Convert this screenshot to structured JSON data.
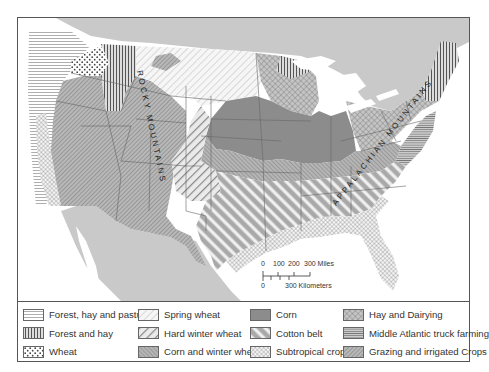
{
  "map": {
    "title": "Agricultural regions of the United States",
    "labels": {
      "rocky": "ROCKY MOUNTAINS",
      "appalachian": "APPALACHIAN MOUNTAINS"
    },
    "colors": {
      "water": "#ffffff",
      "foreign_land": "#c9c9c9",
      "pattern_gray": "#8a8a8a",
      "corn_fill": "#8c8c8c",
      "border": "#555555"
    }
  },
  "scale": {
    "miles_ticks": [
      "0",
      "100",
      "200",
      "300 Miles"
    ],
    "km_ticks": [
      "0",
      "300 Kilometers"
    ]
  },
  "legend": {
    "items": [
      {
        "label": "Forest, hay and pasture",
        "pattern": "horizontal-lines"
      },
      {
        "label": "Forest and hay",
        "pattern": "vertical-lines"
      },
      {
        "label": "Wheat",
        "pattern": "dots"
      },
      {
        "label": "Spring wheat",
        "pattern": "light-diagonal"
      },
      {
        "label": "Hard winter wheat",
        "pattern": "wide-diagonal"
      },
      {
        "label": "Corn and winter wheat",
        "pattern": "dense-forward-diagonal"
      },
      {
        "label": "Corn",
        "pattern": "solid-gray"
      },
      {
        "label": "Cotton belt",
        "pattern": "wide-white-stripes"
      },
      {
        "label": "Subtropical crops",
        "pattern": "crosshatch-light"
      },
      {
        "label": "Hay and Dairying",
        "pattern": "crosshatch"
      },
      {
        "label": "Middle Atlantic truck farming",
        "pattern": "horizontal-dense"
      },
      {
        "label": "Grazing and irrigated Crops",
        "pattern": "dense-back-diagonal"
      }
    ]
  }
}
